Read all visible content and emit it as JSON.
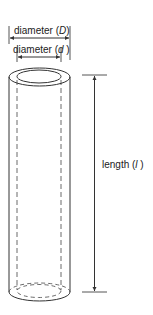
{
  "diagram": {
    "type": "cylinder-tube-dimensions",
    "labels": {
      "outer_diameter": {
        "prefix": "diameter (",
        "symbol": "D",
        "suffix": ")"
      },
      "inner_diameter": {
        "prefix": "diameter (",
        "symbol": "d",
        "suffix": " )"
      },
      "length": {
        "prefix": "length (",
        "symbol": "l",
        "suffix": " )"
      }
    },
    "colors": {
      "stroke": "#333333",
      "dimension_line": "#555555",
      "text": "#222222",
      "background": "#ffffff"
    }
  }
}
